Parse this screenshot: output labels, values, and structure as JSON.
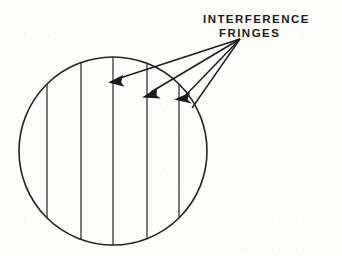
{
  "figure": {
    "kind": "technical-line-diagram",
    "caption_lines": [
      "INTERFERENCE",
      "FRINGES"
    ],
    "label_full_text": "INTERFERENCE FRINGES",
    "colors": {
      "background": "#fdfdfc",
      "ink": "#1b1b1b",
      "stroke": "#232323"
    },
    "viewfield": {
      "name": "circular-field-of-view",
      "shape": "circle",
      "center_x": 113,
      "center_y": 151,
      "radius": 94,
      "stroke_width": 1.6
    },
    "fringes": {
      "name": "interference-fringes",
      "count": 5,
      "orientation": "vertical",
      "stroke_width": 1.2,
      "x_positions": [
        47,
        81,
        113,
        147,
        179
      ]
    },
    "leaders": {
      "name": "leader-arrows",
      "count": 3,
      "convergence_x": 240,
      "convergence_y": 39,
      "arrows": [
        {
          "tip_x": 110,
          "tip_y": 81,
          "target_fringe_index": 2
        },
        {
          "tip_x": 144,
          "tip_y": 94,
          "target_fringe_index": 3
        },
        {
          "tip_x": 177,
          "tip_y": 99,
          "target_fringe_index": 4
        }
      ]
    }
  }
}
